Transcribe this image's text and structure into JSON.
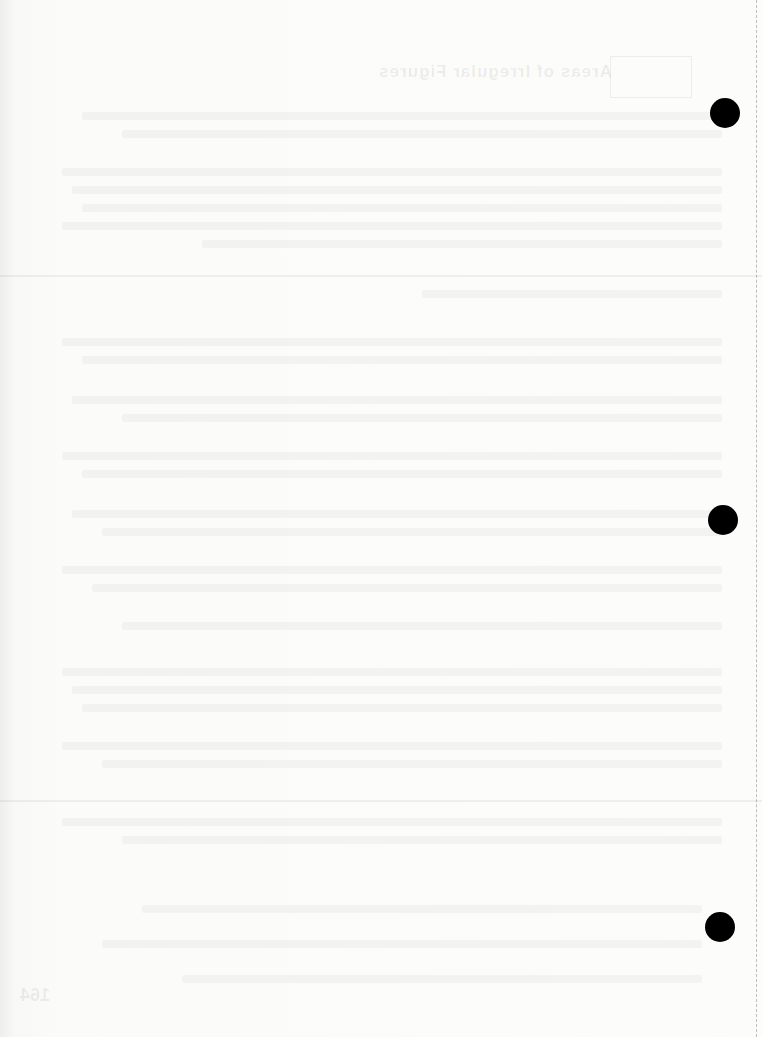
{
  "page": {
    "show_through": {
      "title": "Areas of Irregular Figures",
      "page_number": "164"
    },
    "punch_holes": [
      {
        "x": 725,
        "y": 113
      },
      {
        "x": 723,
        "y": 520
      },
      {
        "x": 720,
        "y": 927
      }
    ],
    "colors": {
      "paper": "#fbfbfa",
      "hole": "#000000"
    }
  }
}
